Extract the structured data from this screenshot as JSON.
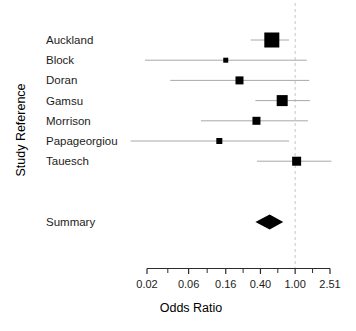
{
  "chart_data": {
    "type": "forest",
    "title": "",
    "xlabel": "Odds Ratio",
    "ylabel": "Study Reference",
    "x_scale": "log",
    "x_range": [
      0.02,
      2.51
    ],
    "x_ticks": [
      0.02,
      0.06,
      0.16,
      0.4,
      1.0,
      2.51
    ],
    "x_tick_labels": [
      "0.02",
      "0.06",
      "0.16",
      "0.40",
      "1.00",
      "2.51"
    ],
    "reference_line": 1.0,
    "reference_line_style": "dashed",
    "grid": false,
    "studies": [
      {
        "label": "Auckland",
        "or": 0.54,
        "ci_low": 0.31,
        "ci_high": 0.85,
        "marker_size": 15
      },
      {
        "label": "Block",
        "or": 0.16,
        "ci_low": 0.019,
        "ci_high": 1.36,
        "marker_size": 5
      },
      {
        "label": "Doran",
        "or": 0.23,
        "ci_low": 0.037,
        "ci_high": 1.45,
        "marker_size": 8
      },
      {
        "label": "Gamsu",
        "or": 0.71,
        "ci_low": 0.35,
        "ci_high": 1.48,
        "marker_size": 11
      },
      {
        "label": "Morrison",
        "or": 0.36,
        "ci_low": 0.083,
        "ci_high": 1.4,
        "marker_size": 8
      },
      {
        "label": "Papageorgiou",
        "or": 0.135,
        "ci_low": 0.013,
        "ci_high": 0.85,
        "marker_size": 6
      },
      {
        "label": "Tauesch",
        "or": 1.04,
        "ci_low": 0.365,
        "ci_high": 2.6,
        "marker_size": 9
      }
    ],
    "summary": {
      "label": "Summary",
      "or": 0.51,
      "ci_low": 0.35,
      "ci_high": 0.73
    }
  },
  "colors": {
    "background": "#ffffff",
    "marker": "#000000",
    "ci_line": "#a8a8a8",
    "reference_line": "#c6c6c6",
    "axis": "#2b2b2b",
    "text": "#1c1c1c"
  }
}
